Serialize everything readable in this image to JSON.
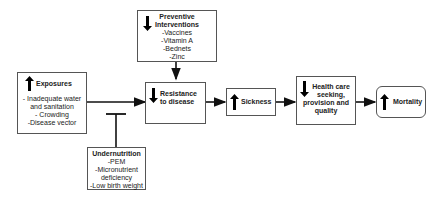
{
  "diagram": {
    "nodes": {
      "exposures": {
        "title": "Exposures",
        "direction": "up",
        "items": [
          "- Inadequate water",
          "and sanitation",
          "- Crowding",
          "-Disease vector"
        ]
      },
      "preventive": {
        "title_line1": "Preventive",
        "title_line2": "Interventions",
        "direction": "down",
        "items": [
          "-Vaccines",
          "-Vitamin A",
          "-Bednets",
          "-Zinc"
        ]
      },
      "resistance": {
        "title_line1": "Resistance",
        "title_line2": "to disease",
        "direction": "down"
      },
      "sickness": {
        "title": "Sickness",
        "direction": "up"
      },
      "healthcare": {
        "title_line1": "Health care",
        "title_line2": "seeking,",
        "title_line3": "provision and",
        "title_line4": "quality",
        "direction": "down"
      },
      "mortality": {
        "title": "Mortality",
        "direction": "up"
      },
      "undernutrition": {
        "title": "Undernutrition",
        "items": [
          "-PEM",
          "-Micronutrient",
          "deficiency",
          "-Low birth weight"
        ]
      }
    },
    "edges": [
      {
        "from": "exposures",
        "to": "resistance",
        "type": "arrow"
      },
      {
        "from": "preventive",
        "to": "resistance",
        "type": "arrow"
      },
      {
        "from": "undernutrition",
        "to": "exposures-resistance-edge",
        "type": "inhibitor"
      },
      {
        "from": "resistance",
        "to": "sickness",
        "type": "arrow"
      },
      {
        "from": "sickness",
        "to": "healthcare",
        "type": "arrow"
      },
      {
        "from": "healthcare",
        "to": "mortality",
        "type": "arrow"
      }
    ]
  }
}
